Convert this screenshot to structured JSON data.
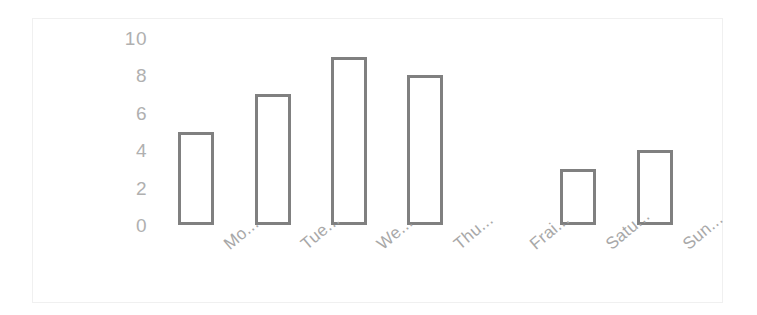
{
  "chart_data": {
    "type": "bar",
    "title": "",
    "subtitle": "",
    "xlabel": "",
    "ylabel": "",
    "categories": [
      "Mo...",
      "Tue...",
      "We...",
      "Thu...",
      "Frai...",
      "Satu...",
      "Sun..."
    ],
    "values": [
      5,
      7,
      9,
      8,
      0,
      3,
      4
    ],
    "ylim": [
      0,
      10
    ],
    "yticks": [
      10,
      8,
      6,
      4,
      2,
      0
    ],
    "ytick_labels": [
      "10",
      "8",
      "6",
      "4",
      "2",
      "0"
    ],
    "grid": false,
    "legend": false,
    "legend_position": "none",
    "bar_style": "outlined",
    "x_label_rotation": -40,
    "annotations": []
  },
  "style": {
    "bar_stroke": "#808080",
    "bar_fill": "#ffffff",
    "axis_text": "#b0b0b0",
    "x_label_text": "#a8a8a8",
    "frame_border": "#f0f0f0",
    "background": "#ffffff"
  }
}
